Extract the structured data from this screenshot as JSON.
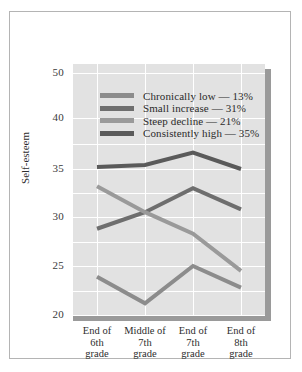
{
  "chart_data": {
    "type": "line",
    "title": "",
    "xlabel": "",
    "ylabel": "Self-esteem",
    "grid": true,
    "legend_position": "inside-top-center",
    "categories": [
      "End of 6th grade",
      "Middle of 7th grade",
      "End of 7th grade",
      "End of 8th grade"
    ],
    "category_lines": [
      [
        "End of",
        "6th",
        "grade"
      ],
      [
        "Middle of",
        "7th",
        "grade"
      ],
      [
        "End of",
        "7th",
        "grade"
      ],
      [
        "End of",
        "8th",
        "grade"
      ]
    ],
    "ytick_labels": [
      "50",
      "40",
      "35",
      "30",
      "25",
      "20"
    ],
    "ytick_values": [
      50,
      40,
      35,
      30,
      25,
      20
    ],
    "ytick_pixels": [
      9,
      54,
      105,
      153,
      202,
      251
    ],
    "ylim": [
      20,
      50
    ],
    "axis_note": "non-linear y-axis: 50 to 40 compressed to same spacing as 5-unit steps",
    "series": [
      {
        "name": "Chronically low",
        "percent": "13%",
        "label": "Chronically low — 13%",
        "color": "#8c8c8c",
        "values": [
          23.9,
          21.2,
          25.0,
          22.8
        ]
      },
      {
        "name": "Small increase",
        "percent": "31%",
        "label": "Small increase — 31%",
        "color": "#6e6e6e",
        "values": [
          28.8,
          30.5,
          33.0,
          30.8
        ]
      },
      {
        "name": "Steep decline",
        "percent": "21%",
        "label": "Steep decline — 21%",
        "color": "#9a9a9a",
        "values": [
          33.2,
          30.5,
          28.3,
          24.5
        ]
      },
      {
        "name": "Consistently high",
        "percent": "35%",
        "label": "Consistently high — 35%",
        "color": "#5a5a5a",
        "values": [
          35.2,
          35.4,
          36.6,
          35.0
        ]
      }
    ],
    "colors": {
      "plot_background": "#e2e2e2",
      "gridline": "#ffffff",
      "shadow": "#9a9a9a",
      "frame": "#b4b4b4",
      "text": "#2e2e2e"
    }
  }
}
